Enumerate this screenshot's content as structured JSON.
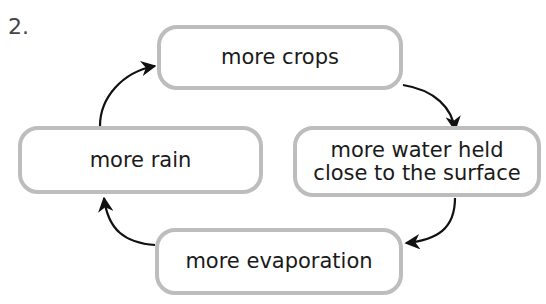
{
  "question_number": "2.",
  "cycle_nodes": [
    {
      "id": "crops",
      "label": "more crops"
    },
    {
      "id": "water",
      "label": "more water held\nclose to the surface"
    },
    {
      "id": "evaporation",
      "label": "more evaporation"
    },
    {
      "id": "rain",
      "label": "more rain"
    }
  ],
  "edges": [
    {
      "from": "more crops",
      "to": "more water held close to the surface"
    },
    {
      "from": "more water held close to the surface",
      "to": "more evaporation"
    },
    {
      "from": "more evaporation",
      "to": "more rain"
    },
    {
      "from": "more rain",
      "to": "more crops"
    }
  ],
  "colors": {
    "box_border": "#bdbdbd",
    "arrow": "#111111",
    "text": "#1a1a1a"
  }
}
